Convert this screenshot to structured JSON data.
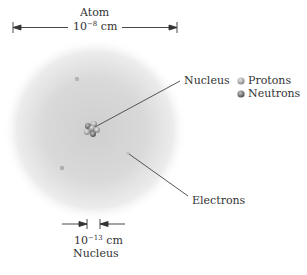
{
  "title": "Atom",
  "atom_size": {
    "base": "10",
    "exp": "−8",
    "unit": "cm"
  },
  "nucleus_size": {
    "base": "10",
    "exp": "−13",
    "unit": "cm"
  },
  "nucleus_size_label": "Nucleus",
  "labels": {
    "nucleus": "Nucleus",
    "electrons": "Electrons"
  },
  "legend": [
    {
      "label": "Protons",
      "color": "#b8b8b8"
    },
    {
      "label": "Neutrons",
      "color": "#8a8a8a"
    }
  ],
  "colors": {
    "cloud_center": "#c8c8c8",
    "cloud_edge": "#ffffff",
    "line": "#444444"
  }
}
